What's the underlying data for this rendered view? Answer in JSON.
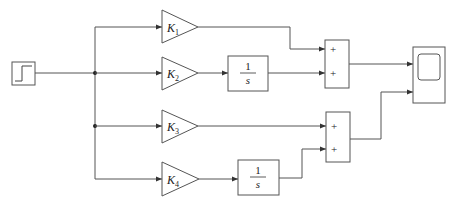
{
  "diagram": {
    "type": "block-diagram",
    "colors": {
      "line": "#555555",
      "text": "#222222",
      "background": "#ffffff"
    },
    "source": {
      "name": "Step",
      "icon": "step-signal-icon"
    },
    "gains": [
      {
        "id": "K1",
        "symbol": "K",
        "subscript": "1"
      },
      {
        "id": "K2",
        "symbol": "K",
        "subscript": "2"
      },
      {
        "id": "K3",
        "symbol": "K",
        "subscript": "3"
      },
      {
        "id": "K4",
        "symbol": "K",
        "subscript": "4"
      }
    ],
    "integrators": [
      {
        "id": "int1",
        "numerator": "1",
        "denominator": "s"
      },
      {
        "id": "int2",
        "numerator": "1",
        "denominator": "s"
      }
    ],
    "sums": [
      {
        "id": "sum1",
        "signs": [
          "+",
          "+"
        ]
      },
      {
        "id": "sum2",
        "signs": [
          "+",
          "+"
        ]
      }
    ],
    "sink": {
      "name": "Scope",
      "icon": "scope-icon"
    }
  }
}
